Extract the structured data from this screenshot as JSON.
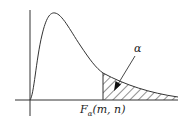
{
  "diagram": {
    "type": "F-distribution density curve with shaded upper tail",
    "tail_label": "α",
    "critical_value_label": {
      "main": "F",
      "subscript": "α",
      "args": "(m, n)"
    },
    "colors": {
      "line": "#333333",
      "hatch": "#333333",
      "background": "#ffffff"
    }
  }
}
